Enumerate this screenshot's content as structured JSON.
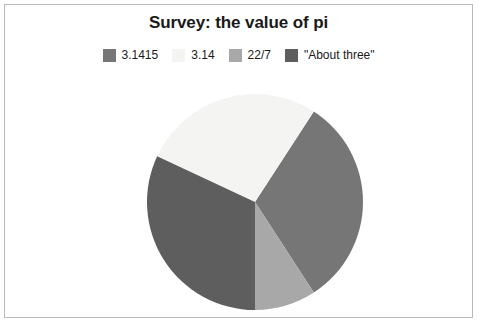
{
  "chart_data": {
    "type": "pie",
    "title": "Survey: the value of pi",
    "xlabel": "",
    "ylabel": "",
    "legend_position": "top",
    "grid": false,
    "categories": [
      "3.1415",
      "3.14",
      "22/7",
      "\"About three\""
    ],
    "values": [
      32,
      35,
      9,
      24
    ],
    "units": "percent",
    "slices": [
      {
        "label": "3.1415",
        "value": 32,
        "color": "#767676",
        "start_angle_deg": -57,
        "end_angle_deg": 57
      },
      {
        "label": "3.14",
        "value": 35,
        "color": "#f4f4f2",
        "start_angle_deg": 205,
        "end_angle_deg": 303
      },
      {
        "label": "22/7",
        "value": 9,
        "color": "#a8a8a8",
        "start_angle_deg": 57,
        "end_angle_deg": 90
      },
      {
        "label": "\"About three\"",
        "value": 24,
        "color": "#5e5e5e",
        "start_angle_deg": 90,
        "end_angle_deg": 205
      }
    ]
  },
  "chart": {
    "title": "Survey: the value of pi",
    "frame_border_color": "#b9b9b9",
    "background_color": "#ffffff"
  },
  "legend": {
    "items": [
      {
        "label": "3.1415",
        "color": "#767676",
        "swatch_name": "legend-swatch-3-1415"
      },
      {
        "label": "3.14",
        "color": "#f4f4f2",
        "swatch_name": "legend-swatch-3-14"
      },
      {
        "label": "22/7",
        "color": "#a8a8a8",
        "swatch_name": "legend-swatch-22-7"
      },
      {
        "label": "\"About three\"",
        "color": "#5e5e5e",
        "swatch_name": "legend-swatch-about-three"
      }
    ]
  },
  "pie": {
    "center_x": 111,
    "center_y": 111,
    "radius": 108
  }
}
